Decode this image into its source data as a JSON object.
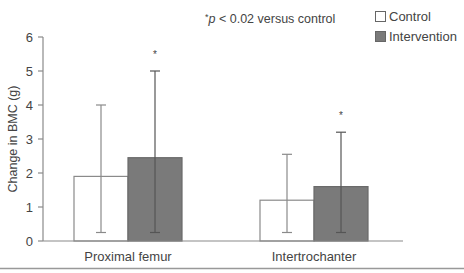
{
  "chart_data": {
    "type": "bar",
    "title": "",
    "annotation": "*p < 0.02 versus control",
    "xlabel": "",
    "ylabel": "Change in BMC (g)",
    "ylim": [
      0,
      6
    ],
    "yticks": [
      "0",
      "1",
      "2",
      "3",
      "4",
      "5",
      "6"
    ],
    "grid": false,
    "legend_position": "top-right",
    "categories": [
      "Proximal femur",
      "Intertrochanter"
    ],
    "series": [
      {
        "name": "Control",
        "color": "#ffffff",
        "values": [
          1.9,
          1.2
        ],
        "error_low": [
          0.25,
          0.25
        ],
        "error_high": [
          4.0,
          2.55
        ],
        "significant": [
          false,
          false
        ]
      },
      {
        "name": "Intervention",
        "color": "#7a7a7a",
        "values": [
          2.45,
          1.6
        ],
        "error_low": [
          0.25,
          0.25
        ],
        "error_high": [
          5.0,
          3.2
        ],
        "significant": [
          true,
          true
        ]
      }
    ],
    "significance_marker": "*"
  },
  "legend": {
    "control": "Control",
    "intervention": "Intervention"
  },
  "annotation": {
    "star": "*",
    "p": "p",
    "rest": " < 0.02 versus control"
  }
}
